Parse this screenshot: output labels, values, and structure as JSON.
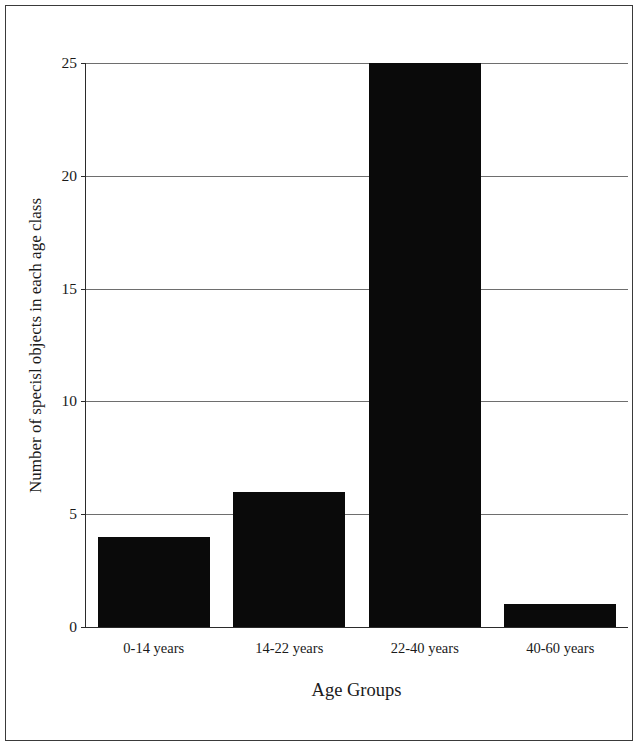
{
  "figure": {
    "background_color": "#ffffff",
    "frame_color": "#3a3a3a",
    "axis_color": "#2b2b2b",
    "grid_color": "#6e6e6e",
    "bar_color": "#0a0a0a"
  },
  "chart_data": {
    "type": "bar",
    "title": "",
    "xlabel": "Age Groups",
    "ylabel": "Number of specisl objects in each age class",
    "categories": [
      "0-14 years",
      "14-22 years",
      "22-40 years",
      "40-60 years"
    ],
    "values": [
      4,
      6,
      25,
      1
    ],
    "ylim": [
      0,
      25
    ],
    "yticks": [
      0,
      5,
      10,
      15,
      20,
      25
    ],
    "ytick_labels": [
      "0",
      "5",
      "10",
      "15",
      "20",
      "25"
    ],
    "grid": "horizontal",
    "legend": "none",
    "bar_color": "#0a0a0a",
    "annotations": []
  }
}
